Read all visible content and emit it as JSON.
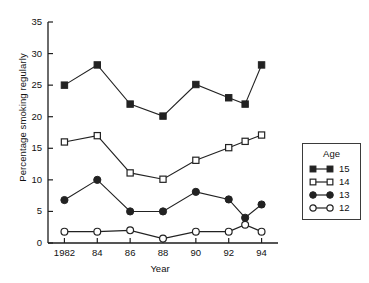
{
  "chart_data": {
    "type": "line",
    "title": "",
    "xlabel": "Year",
    "ylabel": "Percentage smoking regularly",
    "x": [
      1982,
      1984,
      1986,
      1988,
      1990,
      1992,
      1993,
      1994
    ],
    "xtick_values": [
      1982,
      1984,
      1986,
      1988,
      1990,
      1992,
      1994
    ],
    "xtick_labels": [
      "1982",
      "84",
      "86",
      "88",
      "90",
      "92",
      "94"
    ],
    "xlim": [
      1981,
      1995
    ],
    "ytick_values": [
      0,
      5,
      10,
      15,
      20,
      25,
      30,
      35
    ],
    "ytick_labels": [
      "0",
      "5",
      "10",
      "15",
      "20",
      "25",
      "30",
      "35"
    ],
    "ylim": [
      0,
      35
    ],
    "grid": false,
    "legend_position": "right-outside",
    "legend_title": "Age",
    "series": [
      {
        "name": "15",
        "marker": "filled-square",
        "color": "#222222",
        "x": [
          1982,
          1984,
          1986,
          1988,
          1990,
          1992,
          1993,
          1994
        ],
        "values": [
          25,
          28.2,
          22,
          20.1,
          25.1,
          23,
          22,
          28.2
        ]
      },
      {
        "name": "14",
        "marker": "open-square",
        "color": "#222222",
        "x": [
          1982,
          1984,
          1986,
          1988,
          1990,
          1992,
          1993,
          1994
        ],
        "values": [
          16,
          17,
          11.1,
          10.1,
          13.1,
          15.1,
          16.1,
          17.1
        ]
      },
      {
        "name": "13",
        "marker": "filled-circle",
        "color": "#222222",
        "x": [
          1982,
          1984,
          1986,
          1988,
          1990,
          1992,
          1993,
          1994
        ],
        "values": [
          6.8,
          10,
          5,
          5,
          8.1,
          6.9,
          4,
          6.1
        ]
      },
      {
        "name": "12",
        "marker": "open-circle",
        "color": "#222222",
        "x": [
          1982,
          1984,
          1986,
          1988,
          1990,
          1992,
          1993,
          1994
        ],
        "values": [
          1.8,
          1.8,
          2,
          0.7,
          1.8,
          1.8,
          2.9,
          1.8
        ]
      }
    ]
  },
  "legend": {
    "title": "Age",
    "items": [
      {
        "label": "15",
        "marker": "filled-square"
      },
      {
        "label": "14",
        "marker": "open-square"
      },
      {
        "label": "13",
        "marker": "filled-circle"
      },
      {
        "label": "12",
        "marker": "open-circle"
      }
    ]
  },
  "axes": {
    "y_title": "Percentage smoking regularly",
    "x_title": "Year"
  }
}
